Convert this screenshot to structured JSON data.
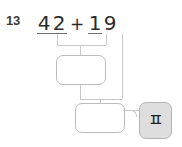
{
  "problem": {
    "number": "13",
    "expression": {
      "tens_left": "4",
      "ones_left": "2",
      "operator": "+",
      "tens_right": "1",
      "ones_right": "9",
      "full_text": "42 + 19"
    }
  },
  "boxes": [
    {
      "name": "ones-sum-box",
      "value": ""
    },
    {
      "name": "final-sum-box",
      "value": ""
    }
  ],
  "key": {
    "glyph": "ㅍ",
    "background": "#dedede",
    "border": "#b4b4b4"
  },
  "colors": {
    "digit": "#2b2b2b",
    "problem_number": "#3b3b3b",
    "underline": "#6e6e6e",
    "connector": "#c9c9c9",
    "box_border": "#bcbcbc",
    "page_background": "#ffffff"
  }
}
